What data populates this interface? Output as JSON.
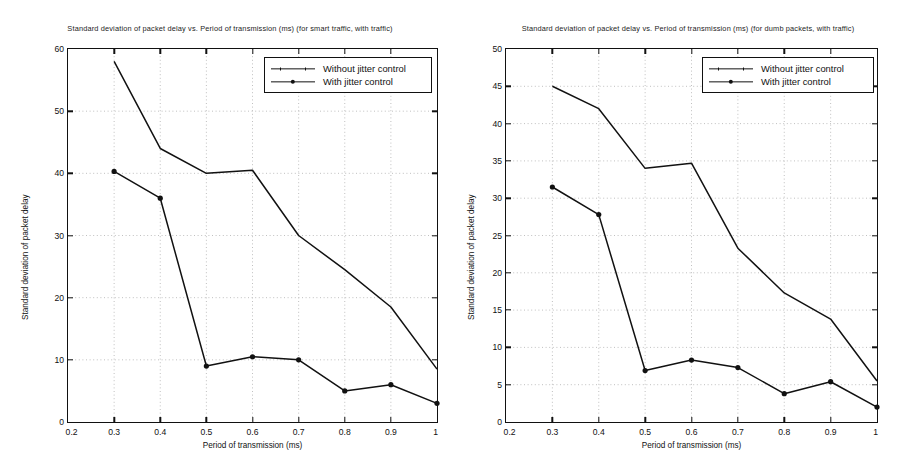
{
  "figures": [
    {
      "id": "smart-traffic",
      "title": "Standard deviation of packet delay vs. Period of transmission (ms) (for smart traffic, with traffic)",
      "legend": [
        {
          "label": "Without jitter control",
          "marker": "none"
        },
        {
          "label": "With jitter control",
          "marker": "filled-circle"
        }
      ]
    },
    {
      "id": "dumb-packets",
      "title": "Standard deviation of packet delay vs. Period of transmission (ms) (for dumb packets, with traffic)",
      "legend": [
        {
          "label": "Without jitter control",
          "marker": "none"
        },
        {
          "label": "With jitter control",
          "marker": "filled-circle"
        }
      ]
    }
  ],
  "chart_data": [
    {
      "type": "line",
      "title": "Standard deviation of packet delay vs. Period of transmission (ms) (for smart traffic, with traffic)",
      "xlabel": "Period of transmission (ms)",
      "ylabel": "Standard deviation of packet delay",
      "xlim": [
        0.2,
        1.0
      ],
      "ylim": [
        0,
        60
      ],
      "xticks": [
        0.2,
        0.3,
        0.4,
        0.5,
        0.6,
        0.7,
        0.8,
        0.9,
        1.0
      ],
      "xticklabels": [
        "0.2",
        "0.3",
        "0.4",
        "0.5",
        "0.6",
        "0.7",
        "0.8",
        "0.9",
        "1"
      ],
      "yticks": [
        0,
        10,
        20,
        30,
        40,
        50,
        60
      ],
      "yticklabels": [
        "0",
        "10",
        "20",
        "30",
        "40",
        "50",
        "60"
      ],
      "grid": true,
      "legend_position": "upper right",
      "x": [
        0.3,
        0.4,
        0.5,
        0.6,
        0.7,
        0.8,
        0.9,
        1.0
      ],
      "series": [
        {
          "name": "Without jitter control",
          "marker": "none",
          "values": [
            58.0,
            44.0,
            40.0,
            40.5,
            30.0,
            24.5,
            18.5,
            8.5
          ]
        },
        {
          "name": "With jitter control",
          "marker": "filled-circle",
          "values": [
            40.3,
            36.0,
            9.0,
            10.5,
            10.0,
            5.0,
            6.0,
            3.0
          ]
        }
      ]
    },
    {
      "type": "line",
      "title": "Standard deviation of packet delay vs. Period of transmission (ms) (for dumb packets, with traffic)",
      "xlabel": "Period of transmission (ms)",
      "ylabel": "Standard deviation of packet delay",
      "xlim": [
        0.2,
        1.0
      ],
      "ylim": [
        0,
        50
      ],
      "xticks": [
        0.2,
        0.3,
        0.4,
        0.5,
        0.6,
        0.7,
        0.8,
        0.9,
        1.0
      ],
      "xticklabels": [
        "0.2",
        "0.3",
        "0.4",
        "0.5",
        "0.6",
        "0.7",
        "0.8",
        "0.9",
        "1"
      ],
      "yticks": [
        0,
        5,
        10,
        15,
        20,
        25,
        30,
        35,
        40,
        45,
        50
      ],
      "yticklabels": [
        "0",
        "5",
        "10",
        "15",
        "20",
        "25",
        "30",
        "35",
        "40",
        "45",
        "50"
      ],
      "grid": true,
      "legend_position": "upper right",
      "x": [
        0.3,
        0.4,
        0.5,
        0.6,
        0.7,
        0.8,
        0.9,
        1.0
      ],
      "series": [
        {
          "name": "Without jitter control",
          "marker": "none",
          "values": [
            45.0,
            42.0,
            34.0,
            34.7,
            23.3,
            17.3,
            13.8,
            5.5
          ]
        },
        {
          "name": "With jitter control",
          "marker": "filled-circle",
          "values": [
            31.5,
            27.8,
            6.9,
            8.3,
            7.3,
            3.8,
            5.4,
            2.0
          ]
        }
      ]
    }
  ],
  "colors": {
    "line": "#111111",
    "grid": "#b9b9b9",
    "axis": "#111111",
    "background": "#ffffff"
  }
}
